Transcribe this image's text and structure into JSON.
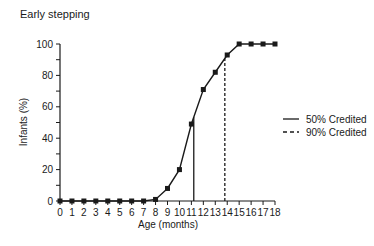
{
  "chart_data": {
    "type": "line",
    "title": "Early stepping",
    "xlabel": "Age  (months)",
    "ylabel": "Infants  (%)",
    "x": [
      0,
      1,
      2,
      3,
      4,
      5,
      6,
      7,
      8,
      9,
      10,
      11,
      12,
      13,
      14,
      15,
      16,
      17,
      18
    ],
    "xticks": [
      "0",
      "1",
      "2",
      "3",
      "4",
      "5",
      "6",
      "7",
      "8",
      "9",
      "10",
      "11",
      "12",
      "13",
      "14",
      "15",
      "16",
      "17",
      "18"
    ],
    "yticks": [
      "0",
      "20",
      "40",
      "60",
      "80",
      "100"
    ],
    "ylim": [
      0,
      100
    ],
    "xlim": [
      0,
      18
    ],
    "grid": false,
    "series": [
      {
        "name": "Infants stepping (%)",
        "values": [
          0,
          0,
          0,
          0,
          0,
          0,
          0,
          0,
          1,
          8,
          20,
          49,
          71,
          82,
          93,
          100,
          100,
          100,
          100
        ],
        "marker": "square"
      }
    ],
    "reference_lines": [
      {
        "name": "50% Credited",
        "x": 11.2,
        "style": "solid"
      },
      {
        "name": "90% Credited",
        "x": 13.8,
        "style": "dashed"
      }
    ],
    "legend": {
      "position": "right",
      "entries": [
        {
          "label": "50% Credited",
          "style": "solid"
        },
        {
          "label": "90% Credited",
          "style": "dashed"
        }
      ]
    }
  }
}
